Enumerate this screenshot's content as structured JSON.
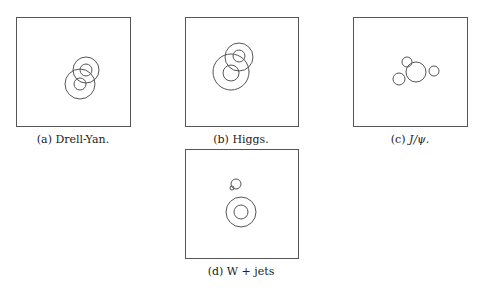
{
  "figure": {
    "panels": [
      {
        "id": "a",
        "label": "(a)",
        "title": "Drell-Yan.",
        "box": {
          "x": 16,
          "y": 17,
          "w": 114,
          "h": 109
        },
        "caption_pos": {
          "x": 73,
          "y": 133
        },
        "circles": [
          {
            "cx": 86,
            "cy": 70,
            "r": 13
          },
          {
            "cx": 86,
            "cy": 70,
            "r": 6
          },
          {
            "cx": 80,
            "cy": 84,
            "r": 15
          },
          {
            "cx": 80,
            "cy": 84,
            "r": 6
          }
        ]
      },
      {
        "id": "b",
        "label": "(b)",
        "title": "Higgs.",
        "box": {
          "x": 185,
          "y": 17,
          "w": 113,
          "h": 109
        },
        "caption_pos": {
          "x": 241,
          "y": 133
        },
        "circles": [
          {
            "cx": 239,
            "cy": 57,
            "r": 14
          },
          {
            "cx": 239,
            "cy": 56,
            "r": 6
          },
          {
            "cx": 231,
            "cy": 72,
            "r": 18
          },
          {
            "cx": 231,
            "cy": 73,
            "r": 8
          }
        ]
      },
      {
        "id": "c",
        "label": "(c)",
        "title": "J/ψ.",
        "box": {
          "x": 353,
          "y": 17,
          "w": 114,
          "h": 109
        },
        "caption_pos": {
          "x": 410,
          "y": 133
        },
        "circles": [
          {
            "cx": 416,
            "cy": 72,
            "r": 10
          },
          {
            "cx": 407,
            "cy": 62,
            "r": 5
          },
          {
            "cx": 434,
            "cy": 71,
            "r": 5
          },
          {
            "cx": 399,
            "cy": 79,
            "r": 6
          }
        ]
      },
      {
        "id": "d",
        "label": "(d)",
        "title": "W + jets",
        "box": {
          "x": 185,
          "y": 149,
          "w": 113,
          "h": 109
        },
        "caption_pos": {
          "x": 241,
          "y": 265
        },
        "circles": [
          {
            "cx": 236,
            "cy": 184,
            "r": 5
          },
          {
            "cx": 232,
            "cy": 188,
            "r": 2
          },
          {
            "cx": 241,
            "cy": 212,
            "r": 15
          },
          {
            "cx": 241,
            "cy": 212,
            "r": 7
          }
        ]
      }
    ],
    "style": {
      "box_stroke": "#555555",
      "circle_stroke": "#555555"
    }
  }
}
